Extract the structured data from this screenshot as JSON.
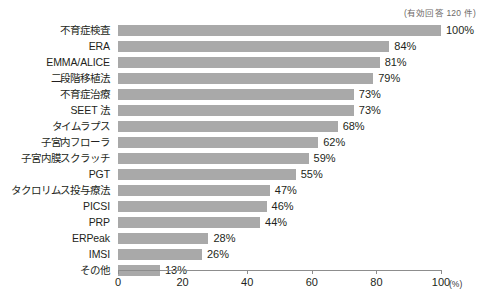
{
  "note": "(有効回答 120 件)",
  "unit_label": "(%)",
  "chart_data": {
    "type": "bar",
    "orientation": "horizontal",
    "title": "",
    "subtitle": "",
    "xlabel": "(%)",
    "ylabel": "",
    "xlim": [
      0,
      100
    ],
    "xticks": [
      0,
      20,
      40,
      60,
      80,
      100
    ],
    "xtick_labels": [
      "0",
      "20",
      "40",
      "60",
      "80",
      "100"
    ],
    "grid": false,
    "legend": false,
    "annotations": [
      "(有効回答 120 件)"
    ],
    "bar_color": "#a9a9a9",
    "categories": [
      "不育症検査",
      "ERA",
      "EMMA/ALICE",
      "二段階移植法",
      "不育症治療",
      "SEET 法",
      "タイムラプス",
      "子宮内フローラ",
      "子宮内膜スクラッチ",
      "PGT",
      "タクロリムス投与療法",
      "PICSI",
      "PRP",
      "ERPeak",
      "IMSI",
      "その他"
    ],
    "values": [
      100,
      84,
      81,
      79,
      73,
      73,
      68,
      62,
      59,
      55,
      47,
      46,
      44,
      28,
      26,
      13
    ],
    "value_labels": [
      "100%",
      "84%",
      "81%",
      "79%",
      "73%",
      "73%",
      "68%",
      "62%",
      "59%",
      "55%",
      "47%",
      "46%",
      "44%",
      "28%",
      "26%",
      "13%"
    ]
  }
}
